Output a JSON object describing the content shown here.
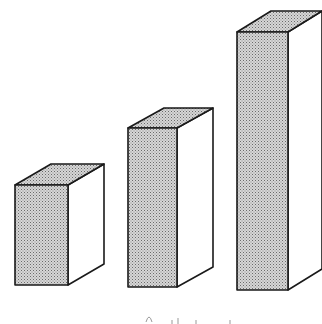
{
  "chart_data": {
    "type": "bar",
    "style": "3d-isometric-stippled",
    "title": "",
    "xlabel": "",
    "ylabel": "",
    "grid": false,
    "legend": null,
    "categories": [
      "",
      "",
      ""
    ],
    "values": [
      100,
      159,
      258
    ],
    "value_units": "relative front-face height (px), no axis shown",
    "relative_ratios": [
      1.0,
      1.59,
      2.58
    ],
    "caption_cropped": true
  },
  "bars": [
    {
      "front": [
        15,
        185,
        68,
        285
      ],
      "depth": [
        36,
        -21
      ]
    },
    {
      "front": [
        128,
        128,
        177,
        287
      ],
      "depth": [
        36,
        -20
      ]
    },
    {
      "front": [
        237,
        32,
        288,
        290
      ],
      "depth": [
        34,
        -21
      ]
    }
  ],
  "colors": {
    "stroke": "#1a1a1a",
    "front_fill": "#bdbdbd",
    "top_fill": "#c8c8c8",
    "side_fill": "#ffffff"
  }
}
